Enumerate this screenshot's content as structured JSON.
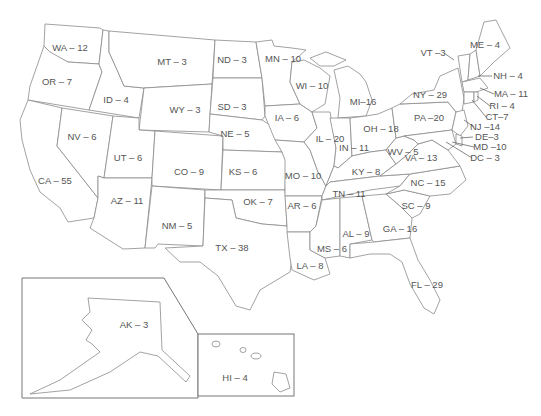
{
  "map": {
    "title": "US Electoral Votes by State",
    "states": [
      {
        "abbr": "WA",
        "votes": 12,
        "label": "WA – 12",
        "x": 70,
        "y": 48
      },
      {
        "abbr": "OR",
        "votes": 7,
        "label": "OR – 7",
        "x": 57,
        "y": 82
      },
      {
        "abbr": "ID",
        "votes": 4,
        "label": "ID – 4",
        "x": 116,
        "y": 100
      },
      {
        "abbr": "MT",
        "votes": 3,
        "label": "MT – 3",
        "x": 172,
        "y": 62
      },
      {
        "abbr": "WY",
        "votes": 3,
        "label": "WY – 3",
        "x": 185,
        "y": 110
      },
      {
        "abbr": "ND",
        "votes": 3,
        "label": "ND – 3",
        "x": 232,
        "y": 60
      },
      {
        "abbr": "SD",
        "votes": 3,
        "label": "SD – 3",
        "x": 232,
        "y": 107
      },
      {
        "abbr": "NE",
        "votes": 5,
        "label": "NE – 5",
        "x": 235,
        "y": 134
      },
      {
        "abbr": "MN",
        "votes": 10,
        "label": "MN – 10",
        "x": 283,
        "y": 59
      },
      {
        "abbr": "WI",
        "votes": 10,
        "label": "WI – 10",
        "x": 312,
        "y": 86
      },
      {
        "abbr": "IA",
        "votes": 6,
        "label": "IA – 6",
        "x": 287,
        "y": 118
      },
      {
        "abbr": "MI",
        "votes": 16,
        "label": "MI–16",
        "x": 363,
        "y": 102
      },
      {
        "abbr": "IL",
        "votes": 20,
        "label": "IL – 20",
        "x": 330,
        "y": 139
      },
      {
        "abbr": "IN",
        "votes": 11,
        "label": "IN – 11",
        "x": 354,
        "y": 148
      },
      {
        "abbr": "OH",
        "votes": 18,
        "label": "OH – 18",
        "x": 381,
        "y": 129
      },
      {
        "abbr": "NV",
        "votes": 6,
        "label": "NV – 6",
        "x": 82,
        "y": 137
      },
      {
        "abbr": "UT",
        "votes": 6,
        "label": "UT – 6",
        "x": 128,
        "y": 158
      },
      {
        "abbr": "CO",
        "votes": 9,
        "label": "CO – 9",
        "x": 189,
        "y": 172
      },
      {
        "abbr": "KS",
        "votes": 6,
        "label": "KS – 6",
        "x": 243,
        "y": 172
      },
      {
        "abbr": "MO",
        "votes": 10,
        "label": "MO – 10",
        "x": 303,
        "y": 176
      },
      {
        "abbr": "KY",
        "votes": 8,
        "label": "KY – 8",
        "x": 366,
        "y": 172
      },
      {
        "abbr": "WV",
        "votes": 5,
        "label": "WV – 5",
        "x": 403,
        "y": 152
      },
      {
        "abbr": "VA",
        "votes": 13,
        "label": "VA – 13",
        "x": 421,
        "y": 158
      },
      {
        "abbr": "CA",
        "votes": 55,
        "label": "CA – 55",
        "x": 55,
        "y": 181
      },
      {
        "abbr": "AZ",
        "votes": 11,
        "label": "AZ – 11",
        "x": 127,
        "y": 201
      },
      {
        "abbr": "NM",
        "votes": 5,
        "label": "NM – 5",
        "x": 177,
        "y": 226
      },
      {
        "abbr": "OK",
        "votes": 7,
        "label": "OK – 7",
        "x": 258,
        "y": 202
      },
      {
        "abbr": "AR",
        "votes": 6,
        "label": "AR – 6",
        "x": 302,
        "y": 206
      },
      {
        "abbr": "TN",
        "votes": 11,
        "label": "TN – 11",
        "x": 349,
        "y": 194
      },
      {
        "abbr": "NC",
        "votes": 15,
        "label": "NC – 15",
        "x": 428,
        "y": 183
      },
      {
        "abbr": "SC",
        "votes": 9,
        "label": "SC – 9",
        "x": 416,
        "y": 206
      },
      {
        "abbr": "GA",
        "votes": 16,
        "label": "GA – 16",
        "x": 400,
        "y": 229
      },
      {
        "abbr": "AL",
        "votes": 9,
        "label": "AL – 9",
        "x": 356,
        "y": 234
      },
      {
        "abbr": "MS",
        "votes": 6,
        "label": "MS – 6",
        "x": 332,
        "y": 249
      },
      {
        "abbr": "TX",
        "votes": 38,
        "label": "TX – 38",
        "x": 232,
        "y": 248
      },
      {
        "abbr": "LA",
        "votes": 8,
        "label": "LA – 8",
        "x": 310,
        "y": 266
      },
      {
        "abbr": "FL",
        "votes": 29,
        "label": "FL – 29",
        "x": 427,
        "y": 285
      },
      {
        "abbr": "NY",
        "votes": 29,
        "label": "NY – 29",
        "x": 430,
        "y": 95
      },
      {
        "abbr": "PA",
        "votes": 20,
        "label": "PA –20",
        "x": 429,
        "y": 118
      },
      {
        "abbr": "VT",
        "votes": 3,
        "label": "VT –3",
        "x": 433,
        "y": 53
      },
      {
        "abbr": "ME",
        "votes": 4,
        "label": "ME – 4",
        "x": 485,
        "y": 45
      },
      {
        "abbr": "NH",
        "votes": 4,
        "label": "NH – 4",
        "x": 508,
        "y": 76
      },
      {
        "abbr": "MA",
        "votes": 11,
        "label": "MA – 11",
        "x": 511,
        "y": 94
      },
      {
        "abbr": "RI",
        "votes": 4,
        "label": "RI – 4",
        "x": 502,
        "y": 106
      },
      {
        "abbr": "CT",
        "votes": 7,
        "label": "CT–7",
        "x": 497,
        "y": 117
      },
      {
        "abbr": "NJ",
        "votes": 14,
        "label": "NJ –14",
        "x": 485,
        "y": 127
      },
      {
        "abbr": "DE",
        "votes": 3,
        "label": "DE–3",
        "x": 487,
        "y": 137
      },
      {
        "abbr": "MD",
        "votes": 10,
        "label": "MD –10",
        "x": 490,
        "y": 147
      },
      {
        "abbr": "DC",
        "votes": 3,
        "label": "DC – 3",
        "x": 485,
        "y": 158
      },
      {
        "abbr": "AK",
        "votes": 3,
        "label": "AK – 3",
        "x": 134,
        "y": 325
      },
      {
        "abbr": "HI",
        "votes": 4,
        "label": "HI – 4",
        "x": 235,
        "y": 378
      }
    ]
  }
}
